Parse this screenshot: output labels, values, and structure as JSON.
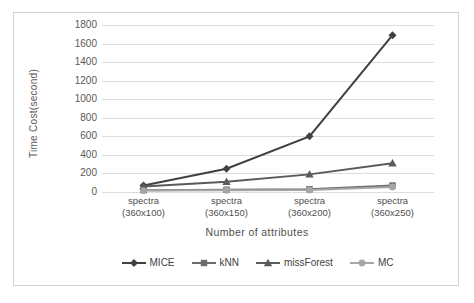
{
  "chart_data": {
    "type": "line",
    "title": "",
    "xlabel": "Number of attributes",
    "ylabel": "Time Cost(second)",
    "categories": [
      "spectra\n(360x100)",
      "spectra\n(360x150)",
      "spectra\n(360x200)",
      "spectra\n(360x250)"
    ],
    "category_lines": [
      {
        "line1": "spectra",
        "line2": "(360x100)"
      },
      {
        "line1": "spectra",
        "line2": "(360x150)"
      },
      {
        "line1": "spectra",
        "line2": "(360x200)"
      },
      {
        "line1": "spectra",
        "line2": "(360x250)"
      }
    ],
    "ylim": [
      0,
      1800
    ],
    "ytick_step": 200,
    "yticks": [
      1800,
      1600,
      1400,
      1200,
      1000,
      800,
      600,
      400,
      200,
      0
    ],
    "grid": true,
    "legend_position": "bottom",
    "series": [
      {
        "name": "MICE",
        "values": [
          70,
          250,
          600,
          1690
        ],
        "marker": "diamond",
        "color": "#404040"
      },
      {
        "name": "kNN",
        "values": [
          20,
          25,
          30,
          70
        ],
        "marker": "square",
        "color": "#6b6b6b"
      },
      {
        "name": "missForest",
        "values": [
          60,
          110,
          190,
          310
        ],
        "marker": "triangle",
        "color": "#5a5a5a"
      },
      {
        "name": "MC",
        "values": [
          15,
          18,
          22,
          55
        ],
        "marker": "circle",
        "color": "#a6a6a6"
      }
    ]
  },
  "axes": {
    "y_title": "Time Cost(second)",
    "x_title": "Number of attributes"
  },
  "legend": {
    "items": [
      {
        "label": "MICE"
      },
      {
        "label": "kNN"
      },
      {
        "label": "missForest"
      },
      {
        "label": "MC"
      }
    ]
  }
}
